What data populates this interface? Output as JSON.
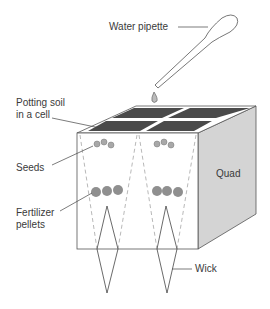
{
  "labels": {
    "pipette": "Water pipette",
    "soil_line1": "Potting soil",
    "soil_line2": "in a cell",
    "seeds": "Seeds",
    "fert_line1": "Fertilizer",
    "fert_line2": "pellets",
    "quad": "Quad",
    "wick": "Wick"
  },
  "colors": {
    "soil": "#4a4a4a",
    "side_face": "#d4d4d4",
    "seed": "#a8a8a8",
    "pellet": "#8f8f8f",
    "line": "#444444"
  }
}
